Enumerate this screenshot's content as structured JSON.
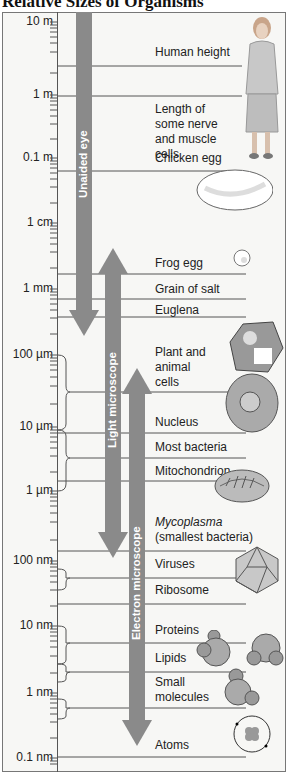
{
  "title": "Relative Sizes of Organisms",
  "scale": [
    {
      "label": "10 m",
      "y": 22
    },
    {
      "label": "1 m",
      "y": 95
    },
    {
      "label": "0.1 m",
      "y": 158
    },
    {
      "label": "1 cm",
      "y": 223
    },
    {
      "label": "1 mm",
      "y": 289
    },
    {
      "label": "100 µm",
      "y": 355
    },
    {
      "label": "10 µm",
      "y": 427
    },
    {
      "label": "1 µm",
      "y": 491
    },
    {
      "label": "100 nm",
      "y": 561
    },
    {
      "label": "10 nm",
      "y": 626
    },
    {
      "label": "1 nm",
      "y": 693
    },
    {
      "label": "0.1 nm",
      "y": 758
    }
  ],
  "items": [
    {
      "label": "Human height",
      "y": 50
    },
    {
      "label": "Length of some nerve and muscle cells",
      "y": 107
    },
    {
      "label": "Chicken egg",
      "y": 153
    },
    {
      "label": "Frog egg",
      "y": 256
    },
    {
      "label": "Grain of salt",
      "y": 282
    },
    {
      "label": "Euglena",
      "y": 306
    },
    {
      "label": "Plant and animal cells",
      "y": 345
    },
    {
      "label": "Nucleus",
      "y": 414
    },
    {
      "label": "Most bacteria",
      "y": 440
    },
    {
      "label": "Mitochondrion",
      "y": 464
    },
    {
      "label": "Mycoplasma",
      "y": 521
    },
    {
      "label": "(smallest bacteria)",
      "y": 537
    },
    {
      "label": "Viruses",
      "y": 557
    },
    {
      "label": "Ribosome",
      "y": 583
    },
    {
      "label": "Proteins",
      "y": 623
    },
    {
      "label": "Lipids",
      "y": 654
    },
    {
      "label": "Small molecules",
      "y": 678
    },
    {
      "label": "Atoms",
      "y": 738
    }
  ],
  "arrows": {
    "unaided_eye": "Unaided eye",
    "light_microscope": "Light microscope",
    "electron_microscope": "Electron microscope"
  },
  "colors": {
    "arrow": "#8a8a8a",
    "frame_bg": "#f7f7f5",
    "line": "#555555"
  }
}
